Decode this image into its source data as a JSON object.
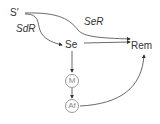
{
  "nodes": {
    "s_prime": "S′",
    "se": "Se",
    "rem": "Rem",
    "m": "M",
    "af": "Af"
  },
  "edge_labels": {
    "sdr": "SdR",
    "ser": "SeR"
  },
  "edges": [
    {
      "from": "S′",
      "to": "Se",
      "label": "SdR"
    },
    {
      "from": "S′",
      "to": "Rem",
      "label": "SeR"
    },
    {
      "from": "Se",
      "to": "Rem"
    },
    {
      "from": "Se",
      "to": "M"
    },
    {
      "from": "M",
      "to": "Af"
    },
    {
      "from": "Af",
      "to": "Rem"
    }
  ]
}
